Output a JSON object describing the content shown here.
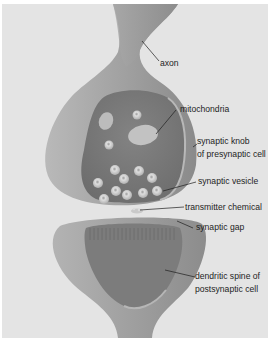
{
  "diagram": {
    "labels": {
      "axon": "axon",
      "mitochondria": "mitochondria",
      "synaptic_knob_1": "synaptic knob",
      "synaptic_knob_2": "of presynaptic cell",
      "synaptic_vesicle": "synaptic vesicle",
      "transmitter_chemical": "transmitter chemical",
      "synaptic_gap": "synaptic gap",
      "dendritic_spine_1": "dendritic spine of",
      "dendritic_spine_2": "postsynaptic cell"
    },
    "colors": {
      "background": "#e4e4e4",
      "border": "#ffffff",
      "membrane_outer": "#9e9e9e",
      "membrane_light": "#c4c4c4",
      "cytoplasm": "#7a7a7a",
      "vesicle": "#cfcfcf",
      "label_text": "#1e1e1e"
    }
  }
}
